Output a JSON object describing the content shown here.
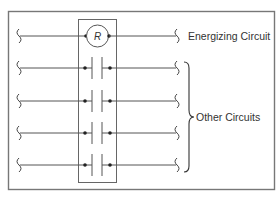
{
  "diagram": {
    "type": "relay-schematic",
    "colors": {
      "line": "#555555",
      "border": "#777777",
      "text": "#333333",
      "background": "#ffffff"
    },
    "relay": {
      "label": "R"
    },
    "labels": {
      "energizing_circuit": "Energizing Circuit",
      "other_circuits": "Other Circuits"
    },
    "rows": [
      {
        "id": "energizing",
        "element": "relay-coil"
      },
      {
        "id": "contact-1",
        "element": "normally-open-contact"
      },
      {
        "id": "contact-2",
        "element": "normally-open-contact"
      },
      {
        "id": "contact-3",
        "element": "normally-open-contact"
      },
      {
        "id": "contact-4",
        "element": "normally-open-contact"
      }
    ]
  }
}
